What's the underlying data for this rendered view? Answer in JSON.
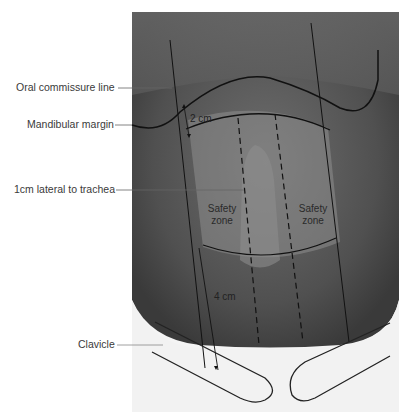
{
  "figure": {
    "labels": {
      "oral_commissure": "Oral commissure line",
      "mandibular_margin": "Mandibular margin",
      "lateral_trachea": "1cm lateral to trachea",
      "clavicle": "Clavicle"
    },
    "measurements": {
      "upper": "2 cm",
      "lower": "4 cm"
    },
    "zones": {
      "left_line1": "Safety",
      "left_line2": "zone",
      "right_line1": "Safety",
      "right_line2": "zone"
    },
    "colors": {
      "background": "#ffffff",
      "skin_dark": "#4a4a4a",
      "zone_fill": "#8a8a8a",
      "line": "#111111",
      "label_text": "#3a3a3a"
    }
  }
}
